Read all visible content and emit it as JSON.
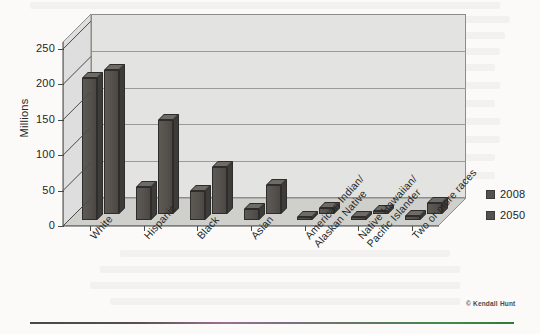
{
  "figure": {
    "credit": "© Kendall Hunt",
    "legend_position": "right"
  },
  "chart_data": {
    "type": "bar",
    "title": "",
    "subtitle": "",
    "xlabel": "",
    "ylabel": "Millions",
    "ylim": [
      0,
      260
    ],
    "yticks": [
      0,
      50,
      100,
      150,
      200,
      250
    ],
    "ytick_labels": [
      "0",
      "50",
      "100",
      "150",
      "200",
      "250"
    ],
    "grid": true,
    "legend": [
      "2008",
      "2050"
    ],
    "categories": [
      "White",
      "Hispanic",
      "Black",
      "Asian",
      "American Indian/\nAlaskan Native",
      "Native Hawaiian/\nPacific Islander",
      "Two or more races"
    ],
    "category_lines": [
      [
        "White"
      ],
      [
        "Hispanic"
      ],
      [
        "Black"
      ],
      [
        "Asian"
      ],
      [
        "American Indian/",
        "Alaskan Native"
      ],
      [
        "Native Hawaiian/",
        "Pacific Islander"
      ],
      [
        "Two or more races"
      ]
    ],
    "series": [
      {
        "name": "2008",
        "values": [
          200,
          47,
          41,
          16,
          3,
          1,
          5
        ]
      },
      {
        "name": "2050",
        "values": [
          204,
          133,
          66,
          41,
          9,
          3,
          16
        ]
      }
    ],
    "colors": {
      "series_2008": "#55524e",
      "series_2050": "#55524e",
      "bar_top": "#6e6b66",
      "bar_side": "#3e3c39",
      "plot_wall": "#e3e3e1",
      "plot_floor": "#d3d3d0",
      "gridline": "#9a9a97",
      "axis": "#4a4a48"
    }
  }
}
